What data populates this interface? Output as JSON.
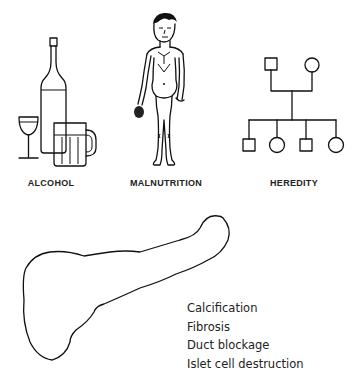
{
  "causes": [
    {
      "label": "ALCOHOL",
      "icon": "alcohol-bottle-glass-mug-icon"
    },
    {
      "label": "MALNUTRITION",
      "icon": "malnourished-man-icon"
    },
    {
      "label": "HEREDITY",
      "icon": "pedigree-chart-icon"
    }
  ],
  "organ": {
    "icon": "pancreas-outline"
  },
  "effects": [
    "Calcification",
    "Fibrosis",
    "Duct blockage",
    "Islet cell destruction"
  ]
}
